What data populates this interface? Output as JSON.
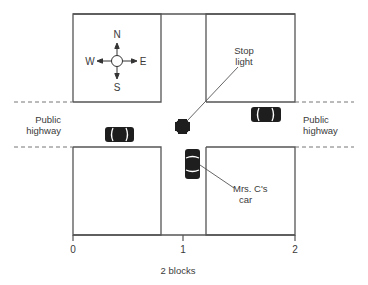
{
  "diagram": {
    "compass": {
      "north": "N",
      "south": "S",
      "east": "E",
      "west": "W"
    },
    "labels": {
      "stop_light_line1": "Stop",
      "stop_light_line2": "light",
      "mrs_c_car_line1": "Mrs. C's",
      "mrs_c_car_line2": "car",
      "highway_left_line1": "Public",
      "highway_left_line2": "highway",
      "highway_right_line1": "Public",
      "highway_right_line2": "highway"
    },
    "scale": {
      "ticks": [
        "0",
        "1",
        "2"
      ],
      "caption": "2 blocks"
    },
    "elements": {
      "stop_light": "stop-light",
      "cars": [
        {
          "name": "car-west-of-intersection",
          "orientation": "horizontal"
        },
        {
          "name": "car-east-of-intersection",
          "orientation": "horizontal"
        },
        {
          "name": "mrs-c-car",
          "orientation": "vertical"
        }
      ]
    },
    "colors": {
      "line": "#555555",
      "fill": "#1e1e1e",
      "text": "#3a3a3a"
    }
  }
}
